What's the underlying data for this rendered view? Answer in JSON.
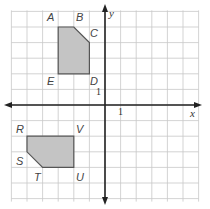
{
  "diagram": {
    "type": "coordinate-grid",
    "x_axis_label": "x",
    "y_axis_label": "y",
    "unit_tick_label": "1",
    "grid": {
      "x_min": -6,
      "x_max": 6,
      "y_min": -6,
      "y_max": 6
    },
    "colors": {
      "grid": "#c8c8c8",
      "axis": "#222222",
      "fill": "#c4c4c4",
      "outline": "#555555"
    },
    "polygons": [
      {
        "name": "ABCDE",
        "vertices": [
          {
            "label": "A",
            "x": -3,
            "y": 5
          },
          {
            "label": "B",
            "x": -2,
            "y": 5
          },
          {
            "label": "C",
            "x": -1,
            "y": 4
          },
          {
            "label": "D",
            "x": -1,
            "y": 2
          },
          {
            "label": "E",
            "x": -3,
            "y": 2
          }
        ]
      },
      {
        "name": "RSTUV",
        "vertices": [
          {
            "label": "R",
            "x": -5,
            "y": -2
          },
          {
            "label": "S",
            "x": -5,
            "y": -3
          },
          {
            "label": "T",
            "x": -4,
            "y": -4
          },
          {
            "label": "U",
            "x": -2,
            "y": -4
          },
          {
            "label": "V",
            "x": -2,
            "y": -2
          }
        ]
      }
    ]
  },
  "labels": {
    "A": "A",
    "B": "B",
    "C": "C",
    "D": "D",
    "E": "E",
    "R": "R",
    "S": "S",
    "T": "T",
    "U": "U",
    "V": "V"
  }
}
